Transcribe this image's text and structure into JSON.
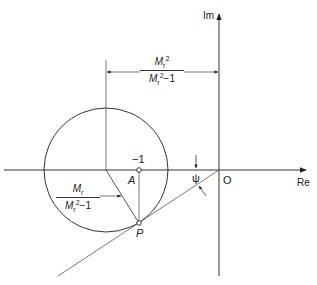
{
  "figure": {
    "type": "M-circle geometry in complex plane (Nyquist)",
    "axes": {
      "real_label": "Re",
      "imag_label": "Im",
      "origin_label": "O"
    },
    "points": {
      "A": {
        "label": "A",
        "value_label": "−1"
      },
      "P": {
        "label": "P"
      }
    },
    "angle_label": "ψ",
    "dimensions": {
      "center_distance": {
        "numerator": "M",
        "numerator_sub": "r",
        "numerator_sup": "2",
        "denominator": "M",
        "denominator_sub": "r",
        "denominator_sup": "2",
        "denominator_tail": "−1"
      },
      "radius": {
        "numerator": "M",
        "numerator_sub": "r",
        "denominator": "M",
        "denominator_sub": "r",
        "denominator_sup": "2",
        "denominator_tail": "−1"
      }
    },
    "colors": {
      "line": "#333333",
      "thin_line": "#555555",
      "background": "#ffffff"
    }
  }
}
